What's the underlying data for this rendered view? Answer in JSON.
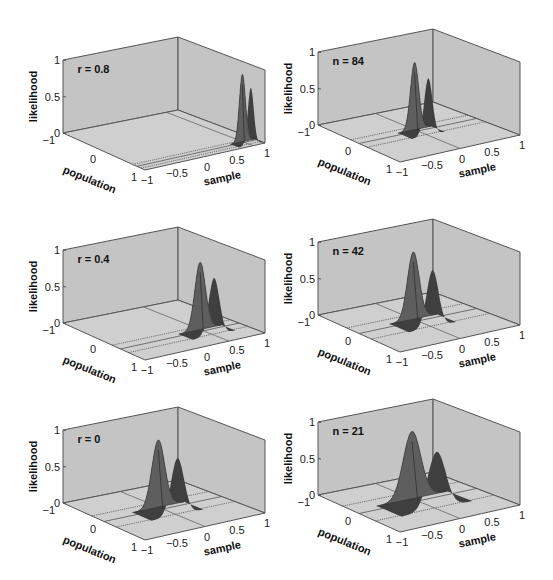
{
  "chart_data": [
    {
      "type": "surface3d",
      "panel": "top-left",
      "annotation": "r = 0.8",
      "zlabel": "likelihood",
      "xlabel": "population",
      "ylabel": "sample",
      "z_ticks": [
        "0",
        "0.5",
        "1"
      ],
      "population_ticks": [
        "-1",
        "0",
        "1"
      ],
      "sample_ticks": [
        "-1",
        "-0.5",
        "0",
        "0.5",
        "1"
      ],
      "zlim": [
        0,
        1
      ],
      "population_lim": [
        -1,
        1
      ],
      "sample_lim": [
        -1,
        1
      ],
      "peak": {
        "sample": 0.8,
        "height": 0.92,
        "width": 0.05
      },
      "floor_lines_population": [
        0.7,
        0.8,
        0.9
      ]
    },
    {
      "type": "surface3d",
      "panel": "top-right",
      "annotation": "n = 84",
      "zlabel": "likelihood",
      "xlabel": "population",
      "ylabel": "sample",
      "z_ticks": [
        "0",
        "0.5",
        "1"
      ],
      "population_ticks": [
        "-1",
        "0",
        "1"
      ],
      "sample_ticks": [
        "-1",
        "-0.5",
        "0",
        "0.5",
        "1"
      ],
      "zlim": [
        0,
        1
      ],
      "population_lim": [
        -1,
        1
      ],
      "sample_lim": [
        -1,
        1
      ],
      "peak": {
        "sample": 0.0,
        "height": 0.92,
        "width": 0.07
      },
      "floor_lines_population": [
        -0.2,
        0.0,
        0.2
      ]
    },
    {
      "type": "surface3d",
      "panel": "middle-left",
      "annotation": "r = 0.4",
      "zlabel": "likelihood",
      "xlabel": "population",
      "ylabel": "sample",
      "z_ticks": [
        "0",
        "0.5",
        "1"
      ],
      "population_ticks": [
        "-1",
        "0",
        "1"
      ],
      "sample_ticks": [
        "-1",
        "-0.5",
        "0",
        "0.5",
        "1"
      ],
      "zlim": [
        0,
        1
      ],
      "population_lim": [
        -1,
        1
      ],
      "sample_lim": [
        -1,
        1
      ],
      "peak": {
        "sample": 0.4,
        "height": 0.92,
        "width": 0.09
      },
      "floor_lines_population": [
        0.2,
        0.4,
        0.6
      ]
    },
    {
      "type": "surface3d",
      "panel": "middle-right",
      "annotation": "n = 42",
      "zlabel": "likelihood",
      "xlabel": "population",
      "ylabel": "sample",
      "z_ticks": [
        "0",
        "0.5",
        "1"
      ],
      "population_ticks": [
        "-1",
        "0",
        "1"
      ],
      "sample_ticks": [
        "-1",
        "-0.5",
        "0",
        "0.5",
        "1"
      ],
      "zlim": [
        0,
        1
      ],
      "population_lim": [
        -1,
        1
      ],
      "sample_lim": [
        -1,
        1
      ],
      "peak": {
        "sample": 0.0,
        "height": 0.92,
        "width": 0.1
      },
      "floor_lines_population": [
        -0.3,
        0.0,
        0.3
      ]
    },
    {
      "type": "surface3d",
      "panel": "bottom-left",
      "annotation": "r = 0",
      "zlabel": "likelihood",
      "xlabel": "population",
      "ylabel": "sample",
      "z_ticks": [
        "0",
        "0.5",
        "1"
      ],
      "population_ticks": [
        "-1",
        "0",
        "1"
      ],
      "sample_ticks": [
        "-1",
        "-0.5",
        "0",
        "0.5",
        "1"
      ],
      "zlim": [
        0,
        1
      ],
      "population_lim": [
        -1,
        1
      ],
      "sample_lim": [
        -1,
        1
      ],
      "peak": {
        "sample": 0.0,
        "height": 0.92,
        "width": 0.11
      },
      "floor_lines_population": [
        -0.3,
        0.0,
        0.3
      ]
    },
    {
      "type": "surface3d",
      "panel": "bottom-right",
      "annotation": "n = 21",
      "zlabel": "likelihood",
      "xlabel": "population",
      "ylabel": "sample",
      "z_ticks": [
        "0",
        "0.5",
        "1"
      ],
      "population_ticks": [
        "-1",
        "0",
        "1"
      ],
      "sample_ticks": [
        "-1",
        "-0.5",
        "0",
        "0.5",
        "1"
      ],
      "zlim": [
        0,
        1
      ],
      "population_lim": [
        -1,
        1
      ],
      "sample_lim": [
        -1,
        1
      ],
      "peak": {
        "sample": 0.0,
        "height": 0.92,
        "width": 0.15
      },
      "floor_lines_population": [
        -0.4,
        0.0,
        0.4
      ]
    }
  ],
  "colors": {
    "wall": "#c4c4c4",
    "floor": "#cfcfcf",
    "edge": "#555555",
    "surface": "#5e5e5e",
    "surface_dark": "#3f3f3f"
  }
}
